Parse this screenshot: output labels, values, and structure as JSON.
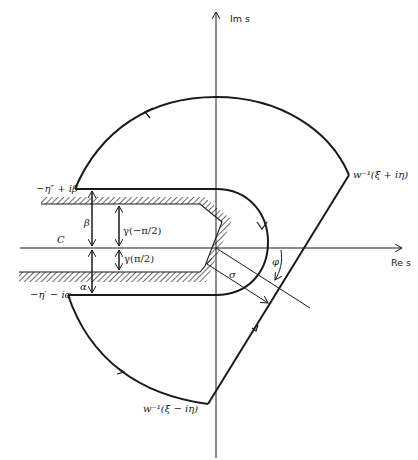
{
  "axes": {
    "imaginary_label": "Im s",
    "real_label": "Re s"
  },
  "points": {
    "upper_left": "−η″ + iβ",
    "lower_left": "−η′ − iα",
    "upper_right": "w⁻¹(ξ + iη)",
    "lower_right": "w⁻¹(ξ − iη)"
  },
  "dimensions": {
    "beta": "β",
    "alpha": "α",
    "gamma_neg": "γ(−π/2)",
    "gamma_pos": "γ(π/2)",
    "sigma": "σ",
    "phi": "φ"
  },
  "contour_label": "C",
  "colors": {
    "line": "#1a1a1a",
    "background": "#ffffff"
  }
}
